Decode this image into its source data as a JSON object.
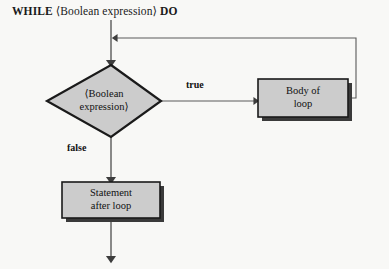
{
  "diagram": {
    "type": "flowchart",
    "title": {
      "keyword_start": "WHILE",
      "expression": "⟨Boolean expression⟩",
      "keyword_end": "DO"
    },
    "background_color": "#f8f8f6",
    "shape_fill_color": "#cccccc",
    "shape_border_color": "#1a1a1a",
    "shadow_color": "#3a3a3a",
    "line_color": "#4a4a4a",
    "nodes": [
      {
        "id": "condition",
        "shape": "diamond",
        "label": "⟨Boolean\nexpression⟩"
      },
      {
        "id": "body",
        "shape": "rectangle",
        "label": "Body of\nloop"
      },
      {
        "id": "statement",
        "shape": "rectangle",
        "label": "Statement\nafter loop"
      }
    ],
    "edges": [
      {
        "id": "entry",
        "from": "start",
        "to": "condition",
        "label": ""
      },
      {
        "id": "true-branch",
        "from": "condition",
        "to": "body",
        "label": "true"
      },
      {
        "id": "false-branch",
        "from": "condition",
        "to": "statement",
        "label": "false"
      },
      {
        "id": "loop-back",
        "from": "body",
        "to": "entry",
        "label": ""
      },
      {
        "id": "exit",
        "from": "statement",
        "to": "end",
        "label": ""
      }
    ]
  }
}
